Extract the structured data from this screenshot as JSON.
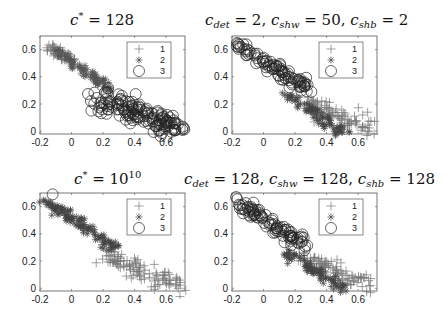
{
  "chart_data": [
    {
      "type": "scatter",
      "panel": "top-left",
      "title": "c* = 128",
      "title_parts": [
        {
          "t": "c",
          "it": true
        },
        {
          "t": "*",
          "sup": true
        },
        {
          "t": " = 128",
          "it": false
        }
      ],
      "xlim": [
        -0.2,
        0.72
      ],
      "ylim": [
        -0.02,
        0.7
      ],
      "xticks": [
        "-0.2",
        "0",
        "0.2",
        "0.4",
        "0.6"
      ],
      "yticks": [
        "0",
        "0.2",
        "0.4",
        "0.6"
      ],
      "legend": [
        "1",
        "2",
        "3"
      ],
      "legend_position": "upper right",
      "series": [
        {
          "name": "1",
          "marker": "plus",
          "color": "#777777",
          "center": [
            [
              -0.17,
              0.63
            ],
            [
              0.0,
              0.53
            ]
          ],
          "n": 40,
          "spread": 0.025
        },
        {
          "name": "2",
          "marker": "star",
          "color": "#555555",
          "center": [
            [
              -0.1,
              0.6
            ],
            [
              0.25,
              0.3
            ]
          ],
          "n": 90,
          "spread": 0.02
        },
        {
          "name": "3",
          "marker": "circle",
          "color": "#222222",
          "center": [
            [
              0.18,
              0.24
            ],
            [
              0.68,
              0.02
            ]
          ],
          "n": 150,
          "spread": 0.045
        }
      ]
    },
    {
      "type": "scatter",
      "panel": "top-right",
      "title": "c_det = 2, c_shw = 50, c_shb = 2",
      "xlim": [
        -0.2,
        0.72
      ],
      "ylim": [
        -0.02,
        0.7
      ],
      "xticks": [
        "-0.2",
        "0",
        "0.2",
        "0.4",
        "0.6"
      ],
      "yticks": [
        "0",
        "0.2",
        "0.4",
        "0.6"
      ],
      "legend": [
        "1",
        "2",
        "3"
      ],
      "legend_position": "upper right",
      "series": [
        {
          "name": "1",
          "marker": "plus",
          "color": "#777777",
          "center": [
            [
              0.28,
              0.22
            ],
            [
              0.66,
              0.02
            ]
          ],
          "n": 90,
          "spread": 0.04
        },
        {
          "name": "2",
          "marker": "star",
          "color": "#444444",
          "center": [
            [
              0.16,
              0.26
            ],
            [
              0.5,
              -0.01
            ]
          ],
          "n": 90,
          "spread": 0.025
        },
        {
          "name": "3",
          "marker": "circle",
          "color": "#222222",
          "center": [
            [
              -0.17,
              0.64
            ],
            [
              0.27,
              0.32
            ]
          ],
          "n": 90,
          "spread": 0.025
        }
      ]
    },
    {
      "type": "scatter",
      "panel": "bottom-left",
      "title": "c* = 10^10",
      "xlim": [
        -0.2,
        0.72
      ],
      "ylim": [
        -0.02,
        0.7
      ],
      "xticks": [
        "-0.2",
        "0",
        "0.2",
        "0.4",
        "0.6"
      ],
      "yticks": [
        "0",
        "0.2",
        "0.4",
        "0.6"
      ],
      "legend": [
        "1",
        "2",
        "3"
      ],
      "legend_position": "upper right",
      "series": [
        {
          "name": "1",
          "marker": "plus",
          "color": "#777777",
          "center": [
            [
              0.18,
              0.26
            ],
            [
              0.66,
              0.02
            ]
          ],
          "n": 110,
          "spread": 0.04
        },
        {
          "name": "2",
          "marker": "star",
          "color": "#444444",
          "center": [
            [
              -0.17,
              0.64
            ],
            [
              0.28,
              0.3
            ]
          ],
          "n": 130,
          "spread": 0.025
        },
        {
          "name": "3",
          "marker": "circle",
          "color": "#222222",
          "center": [
            [
              -0.12,
              0.69
            ],
            [
              -0.12,
              0.69
            ]
          ],
          "n": 1,
          "spread": 0.0
        }
      ]
    },
    {
      "type": "scatter",
      "panel": "bottom-right",
      "title": "c_det = 128, c_shw = 128, c_shb = 128",
      "xlim": [
        -0.2,
        0.72
      ],
      "ylim": [
        -0.02,
        0.7
      ],
      "xticks": [
        "-0.2",
        "0",
        "0.2",
        "0.4",
        "0.6"
      ],
      "yticks": [
        "0",
        "0.2",
        "0.4",
        "0.6"
      ],
      "legend": [
        "1",
        "2",
        "3"
      ],
      "legend_position": "upper right",
      "series": [
        {
          "name": "1",
          "marker": "plus",
          "color": "#777777",
          "center": [
            [
              0.28,
              0.22
            ],
            [
              0.66,
              0.02
            ]
          ],
          "n": 90,
          "spread": 0.04
        },
        {
          "name": "2",
          "marker": "star",
          "color": "#444444",
          "center": [
            [
              0.16,
              0.26
            ],
            [
              0.5,
              -0.01
            ]
          ],
          "n": 90,
          "spread": 0.025
        },
        {
          "name": "3",
          "marker": "circle",
          "color": "#222222",
          "center": [
            [
              -0.17,
              0.64
            ],
            [
              0.27,
              0.32
            ]
          ],
          "n": 90,
          "spread": 0.025
        }
      ]
    }
  ],
  "panels": {
    "tl": {
      "title_a": "c",
      "title_sup": "*",
      "title_b": " = 128"
    },
    "tr": {
      "t1": "c",
      "s1": "det",
      "v1": " = 2, ",
      "t2": "c",
      "s2": "shw",
      "v2": " = 50, ",
      "t3": "c",
      "s3": "shb",
      "v3": " = 2"
    },
    "bl": {
      "title_a": "c",
      "title_sup": "*",
      "title_b": " = 10",
      "title_exp": "10"
    },
    "br": {
      "t1": "c",
      "s1": "det",
      "v1": " = 128, ",
      "t2": "c",
      "s2": "shw",
      "v2": " = 128, ",
      "t3": "c",
      "s3": "shb",
      "v3": " = 128"
    }
  },
  "legend_labels": [
    "1",
    "2",
    "3"
  ],
  "xtick_labels": [
    "-0.2",
    "0",
    "0.2",
    "0.4",
    "0.6"
  ],
  "ytick_labels": [
    "0",
    "0.2",
    "0.4",
    "0.6"
  ]
}
